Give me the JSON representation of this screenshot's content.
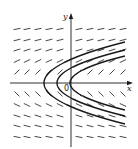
{
  "figure": {
    "type": "direction_field",
    "axes": {
      "x_label": "x",
      "y_label": "y",
      "origin_label": "0"
    },
    "colors": {
      "ink": "#1a1a1a",
      "slope_marks": "#333333",
      "background": "#ffffff"
    },
    "grid": {
      "columns_px": [
        17,
        27,
        38,
        49,
        60,
        79,
        90,
        101,
        112,
        123
      ],
      "rows_px": [
        29,
        40,
        50,
        61,
        72,
        94,
        105,
        116,
        126,
        137
      ],
      "origin_px": [
        71,
        83
      ],
      "segment_length_px": 7
    },
    "solution_curves": [
      {
        "name": "outer",
        "vertex_px": [
          44,
          83
        ],
        "right_edge_offset_px": 41
      },
      {
        "name": "middle",
        "vertex_px": [
          57,
          83
        ],
        "right_edge_offset_px": 33
      },
      {
        "name": "inner",
        "vertex_px": [
          70,
          83
        ],
        "right_edge_offset_px": 27
      }
    ]
  }
}
